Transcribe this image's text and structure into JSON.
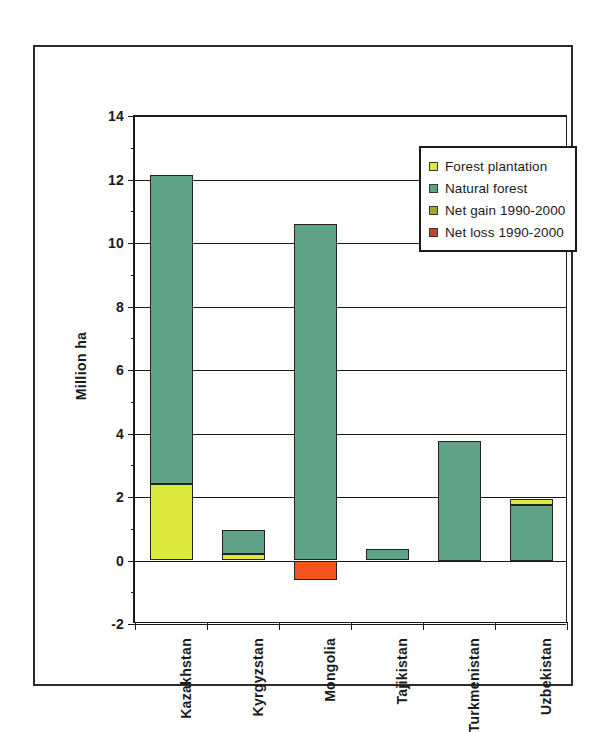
{
  "chart_data": {
    "type": "bar",
    "title": "",
    "xlabel": "",
    "ylabel": "Million ha",
    "ylim": [
      -2,
      14
    ],
    "ytick_step": 2,
    "yticks": [
      "14",
      "12",
      "10",
      "8",
      "6",
      "4",
      "2",
      "0",
      "-2"
    ],
    "grid": true,
    "stacked": true,
    "legend_position": "top-right",
    "categories": [
      "Kazakhstan",
      "Kyrgyzstan",
      "Mongolia",
      "Tajikistan",
      "Turkmenistan",
      "Uzbekistan"
    ],
    "series": [
      {
        "name": "Forest plantation",
        "color": "#dbe83c",
        "values": [
          2.4,
          0.2,
          0.0,
          0.0,
          0.0,
          0.2
        ]
      },
      {
        "name": "Natural forest",
        "color": "#5fa287",
        "values": [
          9.75,
          0.75,
          10.6,
          0.35,
          3.75,
          1.75
        ]
      },
      {
        "name": "Net gain 1990-2000",
        "color": "#9aa83a",
        "values": [
          0.0,
          0.0,
          0.0,
          0.0,
          0.0,
          0.0
        ]
      },
      {
        "name": "Net loss 1990-2000",
        "color": "#f4541f",
        "values": [
          0.0,
          0.0,
          -0.6,
          0.0,
          0.0,
          0.0
        ]
      }
    ],
    "totals": [
      12.15,
      0.95,
      10.6,
      0.35,
      3.75,
      1.95
    ],
    "annotations": []
  },
  "legend": {
    "items": [
      {
        "label": "Forest plantation",
        "color": "#dbe83c"
      },
      {
        "label": "Natural forest",
        "color": "#5fa287"
      },
      {
        "label": "Net gain 1990-2000",
        "color": "#9aa83a"
      },
      {
        "label": "Net loss 1990-2000",
        "color": "#c0452a"
      }
    ]
  }
}
